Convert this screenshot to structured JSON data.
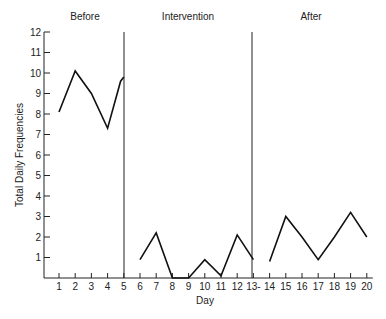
{
  "chart_data": {
    "type": "line",
    "title": "",
    "xlabel": "Day",
    "ylabel": "Total Daily Frequencies",
    "ylim": [
      0,
      12
    ],
    "xlim": [
      0,
      20
    ],
    "y_ticks": [
      1,
      2,
      3,
      4,
      5,
      6,
      7,
      8,
      9,
      10,
      11,
      12
    ],
    "x_tick_labels": [
      "1",
      "2",
      "3",
      "4",
      "5",
      "6",
      "7",
      "8",
      "9",
      "10",
      "11",
      "12",
      "13",
      "14",
      "15",
      "16",
      "17",
      "18",
      "19",
      "20"
    ],
    "grid": false,
    "legend": null,
    "phases": [
      {
        "name": "Before",
        "days": [
          1,
          5
        ]
      },
      {
        "name": "Intervention",
        "days": [
          6,
          13
        ]
      },
      {
        "name": "After",
        "days": [
          14,
          20
        ]
      }
    ],
    "phase_dividers_after_day": [
      5,
      13
    ],
    "series": [
      {
        "name": "Before",
        "x": [
          1,
          2,
          3,
          4,
          4.8,
          5
        ],
        "values": [
          8.1,
          10.1,
          9.0,
          7.3,
          9.6,
          9.8
        ]
      },
      {
        "name": "Intervention",
        "x": [
          6,
          7,
          8,
          9,
          10,
          11,
          12,
          13
        ],
        "values": [
          0.9,
          2.2,
          0,
          0,
          0.9,
          0.1,
          2.1,
          0.9
        ]
      },
      {
        "name": "After",
        "x": [
          14,
          15,
          16,
          17,
          18,
          19,
          20
        ],
        "values": [
          0.8,
          3.0,
          2.0,
          0.9,
          2.0,
          3.2,
          2.0
        ]
      }
    ]
  }
}
